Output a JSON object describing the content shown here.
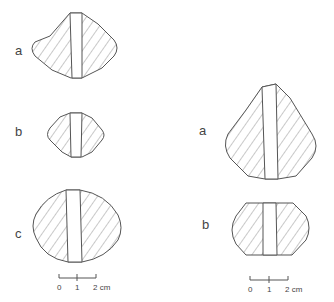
{
  "figure": {
    "left_group": {
      "labels": [
        "a",
        "b",
        "c"
      ],
      "scale": {
        "ticks": [
          "0",
          "1",
          "2 cm"
        ]
      }
    },
    "right_group": {
      "labels": [
        "a",
        "b"
      ],
      "scale": {
        "ticks": [
          "0",
          "1",
          "2 cm"
        ]
      }
    }
  },
  "colors": {
    "stroke": "#555555",
    "hatch": "#777777",
    "background": "#ffffff"
  }
}
